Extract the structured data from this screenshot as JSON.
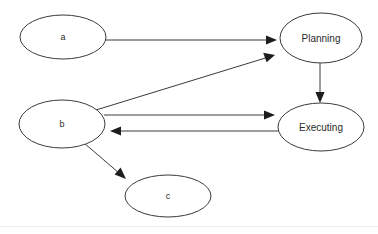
{
  "diagram": {
    "type": "directed-graph",
    "background_color": "#ffffff",
    "stroke_color": "#3a3a3a",
    "arrowhead_color": "#1d1d1d",
    "text_color": "#2b2b2b",
    "nodes": [
      {
        "id": "a",
        "label": "a",
        "shape": "ellipse",
        "cx": 63,
        "cy": 37,
        "rx": 43,
        "ry": 22,
        "font_size": 9
      },
      {
        "id": "planning",
        "label": "Planning",
        "shape": "ellipse",
        "cx": 321,
        "cy": 38,
        "rx": 41,
        "ry": 25,
        "font_size": 10
      },
      {
        "id": "b",
        "label": "b",
        "shape": "ellipse",
        "cx": 62,
        "cy": 124,
        "rx": 43,
        "ry": 24,
        "font_size": 9
      },
      {
        "id": "executing",
        "label": "Executing",
        "shape": "ellipse",
        "cx": 321,
        "cy": 127,
        "rx": 43,
        "ry": 24,
        "font_size": 10
      },
      {
        "id": "c",
        "label": "c",
        "shape": "ellipse",
        "cx": 168,
        "cy": 196,
        "rx": 43,
        "ry": 21,
        "font_size": 9
      }
    ],
    "edges": [
      {
        "id": "a-to-planning",
        "from": "a",
        "to": "planning",
        "x1": 106,
        "y1": 40,
        "x2": 277,
        "y2": 40,
        "directed": true
      },
      {
        "id": "b-to-planning",
        "from": "b",
        "to": "planning",
        "x1": 96,
        "y1": 110,
        "x2": 275,
        "y2": 55,
        "directed": true
      },
      {
        "id": "b-to-executing",
        "from": "b",
        "to": "executing",
        "x1": 104,
        "y1": 115,
        "x2": 275,
        "y2": 115,
        "directed": true
      },
      {
        "id": "executing-to-b",
        "from": "executing",
        "to": "b",
        "x1": 281,
        "y1": 131,
        "x2": 110,
        "y2": 131,
        "directed": true
      },
      {
        "id": "planning-to-executing",
        "from": "planning",
        "to": "executing",
        "x1": 320,
        "y1": 62,
        "x2": 320,
        "y2": 102,
        "directed": true
      },
      {
        "id": "b-to-c",
        "from": "b",
        "to": "c",
        "x1": 84,
        "y1": 143,
        "x2": 126,
        "y2": 179,
        "directed": true
      }
    ]
  }
}
